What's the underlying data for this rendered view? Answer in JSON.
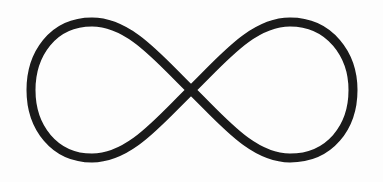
{
  "image": {
    "subject": "infinity-symbol",
    "background_color": "#fdfdfd",
    "stroke_color": "#1a1a1a",
    "stroke_width": 9
  }
}
